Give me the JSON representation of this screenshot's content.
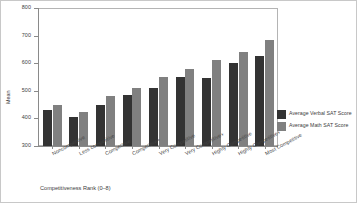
{
  "chart_data": {
    "type": "bar",
    "title": "",
    "xlabel": "Competitiveness Rank (0–8)",
    "ylabel": "Mean",
    "ylim": [
      300,
      800
    ],
    "yticks": [
      "300",
      "400",
      "500",
      "600",
      "700",
      "800"
    ],
    "ytick_values": [
      300,
      400,
      500,
      600,
      700,
      800
    ],
    "grid": false,
    "legend_position": "right",
    "categories": [
      "Noncompetitive",
      "Less competitive",
      "Competitive",
      "Competitive+",
      "Very Competitive",
      "Very Competitive+",
      "Highly Competitive",
      "Highly Competitive+",
      "Most Competitive"
    ],
    "series": [
      {
        "name": "Average Verbal SAT Score",
        "color": "#333333",
        "values": [
          430,
          405,
          450,
          485,
          510,
          550,
          545,
          600,
          625
        ]
      },
      {
        "name": "Average Math SAT Score",
        "color": "#808080",
        "values": [
          450,
          425,
          480,
          510,
          550,
          580,
          610,
          640,
          685
        ]
      }
    ]
  },
  "legend": {
    "items": [
      {
        "label": "Average Verbal SAT Score",
        "color": "#333333"
      },
      {
        "label": "Average Math SAT Score",
        "color": "#808080"
      }
    ]
  },
  "axes": {
    "y_title": "Mean",
    "x_title": "Competitiveness Rank (0–8)"
  }
}
